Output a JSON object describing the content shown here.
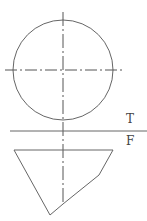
{
  "views": {
    "top_label": "T",
    "front_label": "F"
  },
  "colors": {
    "stroke": "#555555",
    "background": "#ffffff"
  }
}
